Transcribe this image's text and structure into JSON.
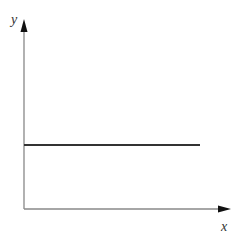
{
  "diagram": {
    "type": "constant-function-graph",
    "axes": {
      "x_label": "x",
      "y_label": "y",
      "axis_color": "#888888",
      "arrow_color": "#111111"
    },
    "line": {
      "description": "horizontal line (constant function)",
      "color": "#333333"
    }
  }
}
